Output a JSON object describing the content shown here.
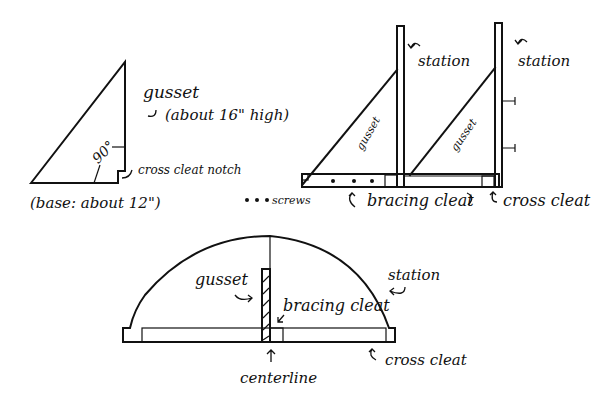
{
  "diagram": {
    "panels": [
      {
        "id": "gusset-shape",
        "labels": {
          "part": "gusset",
          "height_note": "(about 16\" high)",
          "angle": "90°",
          "notch": "cross cleat notch",
          "base_note": "(base: about 12\")"
        }
      },
      {
        "id": "side-view",
        "labels": {
          "station_left": "station",
          "station_right": "station",
          "gusset_left": "gusset",
          "gusset_right": "gusset",
          "screws": "screws",
          "bracing_cleat": "bracing cleat",
          "cross_cleat": "cross cleat"
        }
      },
      {
        "id": "front-view",
        "labels": {
          "gusset": "gusset",
          "bracing_cleat": "bracing cleat",
          "station": "station",
          "cross_cleat": "cross cleat",
          "centerline": "centerline"
        }
      }
    ],
    "colors": {
      "ink": "#111111",
      "paper": "#ffffff"
    }
  }
}
